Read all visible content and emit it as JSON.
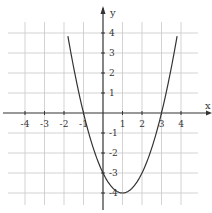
{
  "chart_data": {
    "type": "line",
    "title": "",
    "xlabel": "x",
    "ylabel": "y",
    "function": "y = x^2 - 2x - 3",
    "x_ticks": [
      -4,
      -3,
      -2,
      -1,
      1,
      2,
      3,
      4
    ],
    "y_ticks": [
      -4,
      -3,
      -2,
      -1,
      1,
      2,
      3,
      4
    ],
    "x_tick_labels": [
      "-4",
      "-3",
      "-2",
      "-1",
      "1",
      "2",
      "3",
      "4"
    ],
    "y_tick_labels": [
      "-4",
      "-3",
      "-2",
      "-1",
      "1",
      "2",
      "3",
      "4"
    ],
    "xlim": [
      -5,
      5
    ],
    "ylim": [
      -5,
      5
    ],
    "grid": true,
    "legend": null,
    "series": [
      {
        "name": "parabola",
        "x": [
          -1.8,
          -1.5,
          -1,
          -0.5,
          0,
          0.5,
          1,
          1.5,
          2,
          2.5,
          3,
          3.5,
          3.8
        ],
        "y": [
          2.84,
          2.25,
          0,
          -1.75,
          -3,
          -3.75,
          -4,
          -3.75,
          -3,
          -1.75,
          0,
          2.25,
          3.84
        ]
      }
    ],
    "key_points": {
      "vertex": [
        1,
        -4
      ],
      "x_intercepts": [
        [
          -1,
          0
        ],
        [
          3,
          0
        ]
      ],
      "y_intercept": [
        0,
        -3
      ]
    }
  },
  "labels": {
    "x_axis": "x",
    "y_axis": "y"
  },
  "colors": {
    "grid": "#c8c8c8",
    "axis": "#333333",
    "curve": "#333333",
    "background": "#ffffff"
  }
}
